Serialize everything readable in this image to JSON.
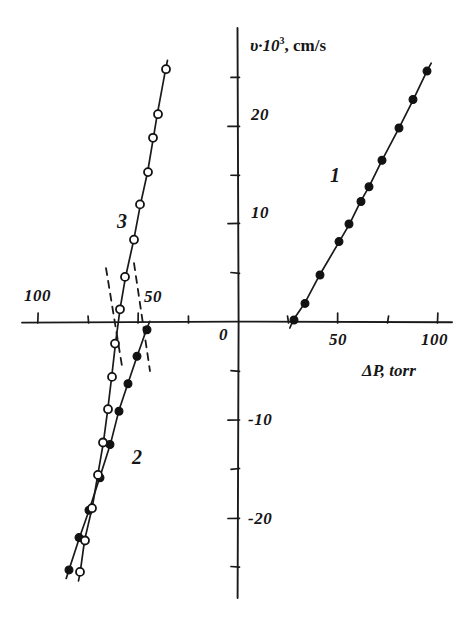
{
  "figure": {
    "kind": "hand-drawn-scientific-plot",
    "background": "#ffffff",
    "ink_color": "#1a1a1a"
  },
  "axes": {
    "x_axis": {
      "title": "ΔP, torr",
      "unit": "torr",
      "symbol": "ΔP",
      "origin_label": "0",
      "right_tick_labels": [
        "50",
        "100"
      ],
      "left_tick_labels": [
        "100",
        "50"
      ]
    },
    "y_axis": {
      "title_symbol": "υ·10",
      "title_exponent": "3",
      "title_unit": ", cm/s",
      "title_full": "υ·10³, cm/s",
      "positive_tick_labels": [
        "10",
        "20"
      ],
      "negative_tick_labels": [
        "-10",
        "-20"
      ]
    }
  },
  "curves": {
    "one": {
      "label": "1",
      "marker": "filled-circle"
    },
    "two": {
      "label": "2",
      "marker": "filled-circle"
    },
    "three": {
      "label": "3",
      "marker": "open-circle"
    }
  },
  "chart_data": {
    "type": "scatter",
    "title": "",
    "subtitle": "",
    "xlabel": "ΔP, torr",
    "ylabel": "υ·10³, cm/s",
    "xlim": [
      -110,
      120
    ],
    "ylim": [
      -28,
      28
    ],
    "grid": false,
    "legend_position": "inline-annotations",
    "x_ticks": [
      -100,
      -75,
      -50,
      -25,
      0,
      25,
      50,
      75,
      100
    ],
    "x_tick_labels": [
      "100",
      "",
      "50",
      "",
      "0",
      "",
      "50",
      "",
      "100"
    ],
    "y_ticks": [
      -25,
      -20,
      -15,
      -10,
      -5,
      0,
      5,
      10,
      15,
      20,
      25
    ],
    "y_tick_labels": [
      "",
      "-20",
      "",
      "-10",
      "",
      "",
      "",
      "10",
      "",
      "20",
      ""
    ],
    "annotations": [
      {
        "text": "1",
        "x": 48,
        "y": 15.5
      },
      {
        "text": "2",
        "x": -52,
        "y": -13.0
      },
      {
        "text": "3",
        "x": -73,
        "y": 7.5
      },
      {
        "text": "0",
        "x": -6,
        "y": -1.8
      }
    ],
    "series": [
      {
        "name": "1",
        "marker": "filled-circle",
        "line": "solid",
        "x_intercept": 28,
        "points": [
          {
            "x": 28.0,
            "y": 0.2
          },
          {
            "x": 33.5,
            "y": 1.9
          },
          {
            "x": 41.0,
            "y": 4.8
          },
          {
            "x": 50.5,
            "y": 8.2
          },
          {
            "x": 55.5,
            "y": 10.0
          },
          {
            "x": 61.5,
            "y": 12.3
          },
          {
            "x": 65.5,
            "y": 13.8
          },
          {
            "x": 72.0,
            "y": 16.5
          },
          {
            "x": 80.5,
            "y": 19.8
          },
          {
            "x": 87.5,
            "y": 22.7
          },
          {
            "x": 94.5,
            "y": 25.6
          }
        ]
      },
      {
        "name": "2",
        "marker": "filled-circle",
        "line": "solid",
        "x_intercept": -44,
        "points": [
          {
            "x": -45.5,
            "y": -0.8
          },
          {
            "x": -50.5,
            "y": -3.5
          },
          {
            "x": -55.0,
            "y": -6.3
          },
          {
            "x": -59.5,
            "y": -9.1
          },
          {
            "x": -64.0,
            "y": -12.5
          },
          {
            "x": -69.0,
            "y": -15.9
          },
          {
            "x": -74.5,
            "y": -19.2
          },
          {
            "x": -79.5,
            "y": -22.0
          },
          {
            "x": -84.5,
            "y": -25.3
          }
        ]
      },
      {
        "name": "3",
        "marker": "open-circle",
        "line": "solid",
        "x_intercept": -62,
        "points": [
          {
            "x": -79.0,
            "y": -25.5
          },
          {
            "x": -76.5,
            "y": -22.3
          },
          {
            "x": -73.0,
            "y": -19.0
          },
          {
            "x": -70.0,
            "y": -15.6
          },
          {
            "x": -67.5,
            "y": -12.3
          },
          {
            "x": -65.0,
            "y": -8.9
          },
          {
            "x": -63.0,
            "y": -5.6
          },
          {
            "x": -61.5,
            "y": -2.2
          },
          {
            "x": -59.0,
            "y": 1.3
          },
          {
            "x": -56.5,
            "y": 4.6
          },
          {
            "x": -52.0,
            "y": 8.4
          },
          {
            "x": -49.0,
            "y": 12.0
          },
          {
            "x": -45.0,
            "y": 15.3
          },
          {
            "x": -42.5,
            "y": 18.8
          },
          {
            "x": -40.0,
            "y": 21.2
          },
          {
            "x": -36.0,
            "y": 25.8
          }
        ]
      }
    ],
    "dashed_extrapolations": [
      {
        "name": "dashed-left",
        "x1": -66,
        "y1": 5.5,
        "x2": -58,
        "y2": -4.5
      },
      {
        "name": "dashed-right",
        "x1": -52,
        "y1": 6.0,
        "x2": -44,
        "y2": -5.0
      }
    ]
  }
}
